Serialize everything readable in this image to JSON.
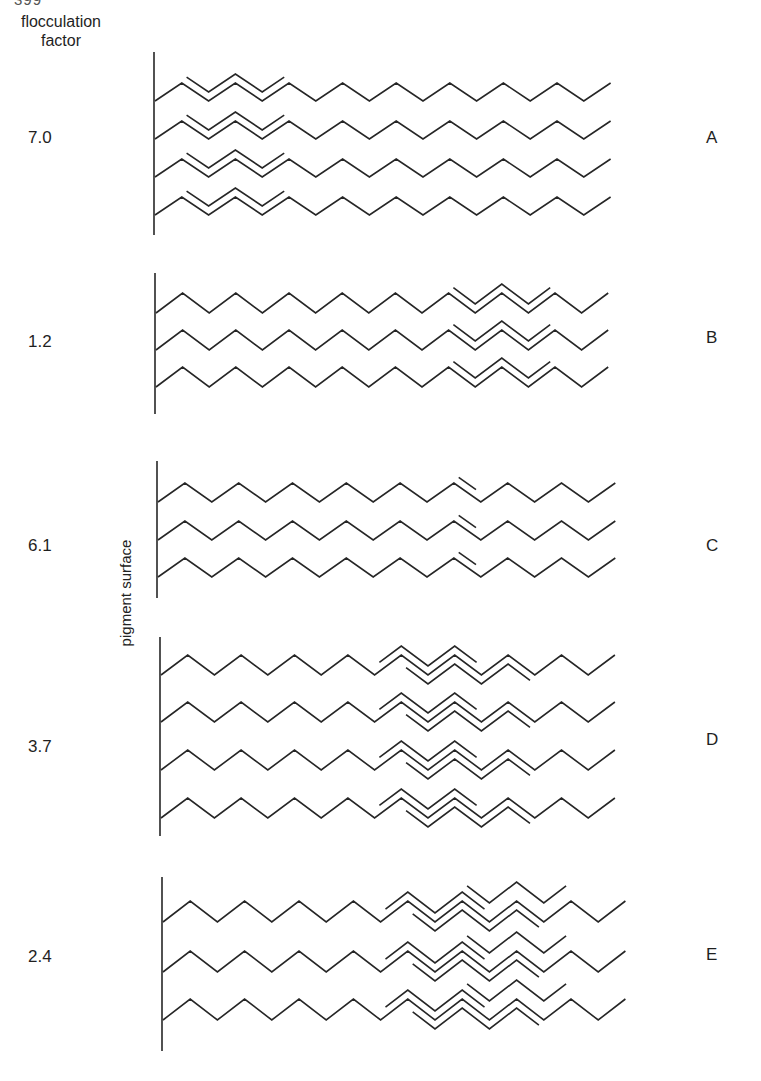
{
  "page_number_fragment": "399",
  "header": {
    "line1": "flocculation",
    "line2": "factor"
  },
  "axis_label": "pigment surface",
  "panels": [
    {
      "id": "A",
      "letter": "A",
      "factor": "7.0",
      "factor_y": 128,
      "letter_y": 128,
      "surface": {
        "x": 154,
        "y1": 52,
        "y2": 235
      },
      "chain": {
        "x0": 155,
        "step": 26.8,
        "amp": 18,
        "segments": 17
      },
      "chain_y": [
        101,
        139,
        177,
        215
      ],
      "overlays": [
        {
          "from": 1,
          "to": 5,
          "offset": -9
        }
      ]
    },
    {
      "id": "B",
      "letter": "B",
      "factor": "1.2",
      "factor_y": 332,
      "letter_y": 328,
      "surface": {
        "x": 155,
        "y1": 273,
        "y2": 414
      },
      "chain": {
        "x0": 156,
        "step": 26.6,
        "amp": 20,
        "segments": 17
      },
      "chain_y": [
        313,
        350,
        387
      ],
      "overlays": [
        {
          "from": 11,
          "to": 15,
          "offset": -9
        }
      ]
    },
    {
      "id": "C",
      "letter": "C",
      "factor": "6.1",
      "factor_y": 536,
      "letter_y": 536,
      "surface": {
        "x": 157,
        "y1": 461,
        "y2": 598
      },
      "chain": {
        "x0": 158,
        "step": 26.9,
        "amp": 19,
        "segments": 17
      },
      "chain_y": [
        502,
        540,
        577
      ],
      "overlays": [
        {
          "from": 11,
          "to": 12,
          "offset": -9
        }
      ]
    },
    {
      "id": "D",
      "letter": "D",
      "factor": "3.7",
      "factor_y": 737,
      "letter_y": 730,
      "surface": {
        "x": 160,
        "y1": 637,
        "y2": 836
      },
      "chain": {
        "x0": 161,
        "step": 26.7,
        "amp": 20,
        "segments": 17
      },
      "chain_y": [
        675,
        722,
        770,
        818
      ],
      "overlays": [
        {
          "from": 8,
          "to": 12,
          "offset": -9
        },
        {
          "from": 9,
          "to": 14,
          "offset": 9
        }
      ]
    },
    {
      "id": "E",
      "letter": "E",
      "factor": "2.4",
      "factor_y": 947,
      "letter_y": 945,
      "surface": {
        "x": 162,
        "y1": 877,
        "y2": 1051
      },
      "chain": {
        "x0": 163,
        "step": 27.2,
        "amp": 21,
        "segments": 17
      },
      "chain_y": [
        922,
        972,
        1020
      ],
      "overlays": [
        {
          "from": 8,
          "to": 12,
          "offset": -9
        },
        {
          "from": 9,
          "to": 14,
          "offset": 9
        },
        {
          "from": 11,
          "to": 15,
          "offset": -19
        }
      ]
    }
  ],
  "colors": {
    "line": "#262626",
    "text": "#1f1f1f",
    "background": "#ffffff"
  }
}
